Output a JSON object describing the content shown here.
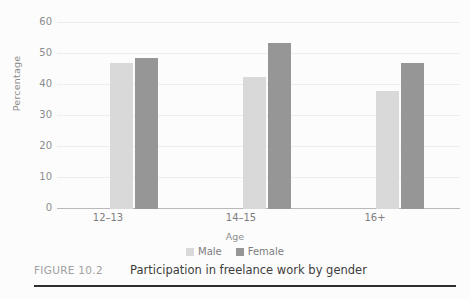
{
  "figure": {
    "tag": "FIGURE 10.2",
    "caption": "Participation in freelance work by gender"
  },
  "legend": {
    "position": "bottom-center",
    "items": [
      {
        "label": "Male",
        "color": "#d9d9d9"
      },
      {
        "label": "Female",
        "color": "#969696"
      }
    ]
  },
  "chart_data": {
    "type": "bar",
    "title": "Participation in freelance work by gender",
    "xlabel": "Age",
    "ylabel": "Percentage",
    "categories": [
      "12–13",
      "14–15",
      "16+"
    ],
    "series": [
      {
        "name": "Male",
        "color": "#d9d9d9",
        "values": [
          42,
          38,
          34
        ]
      },
      {
        "name": "Female",
        "color": "#969696",
        "values": [
          43.5,
          48,
          42
        ]
      }
    ],
    "ylim": [
      0,
      60
    ],
    "ytick_labels": [
      "60",
      "50",
      "40",
      "30",
      "20",
      "10",
      "0"
    ],
    "ytick_values": [
      60,
      50,
      40,
      30,
      20,
      10,
      0
    ],
    "grid": true,
    "legend_position": "bottom-center"
  }
}
